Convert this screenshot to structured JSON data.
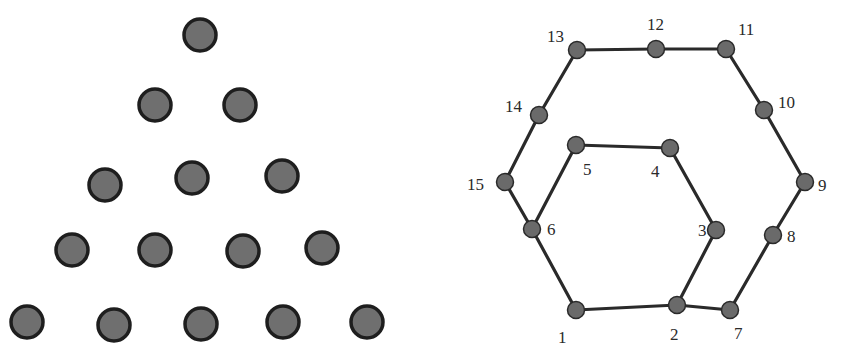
{
  "figure": {
    "left_panel": {
      "description": "Triangular arrangement of 15 circles in 5 rows",
      "rows": [
        1,
        2,
        3,
        4,
        5
      ],
      "fill_color": "#6f6f6f",
      "stroke_color": "#1e1e1e"
    },
    "right_panel": {
      "description": "Graph with 15 numbered vertices forming nested hexagonal paths",
      "node_color": "#6a6a6a",
      "edge_color": "#2a2a2a",
      "nodes": [
        {
          "id": 1,
          "label": "1"
        },
        {
          "id": 2,
          "label": "2"
        },
        {
          "id": 3,
          "label": "3"
        },
        {
          "id": 4,
          "label": "4"
        },
        {
          "id": 5,
          "label": "5"
        },
        {
          "id": 6,
          "label": "6"
        },
        {
          "id": 7,
          "label": "7"
        },
        {
          "id": 8,
          "label": "8"
        },
        {
          "id": 9,
          "label": "9"
        },
        {
          "id": 10,
          "label": "10"
        },
        {
          "id": 11,
          "label": "11"
        },
        {
          "id": 12,
          "label": "12"
        },
        {
          "id": 13,
          "label": "13"
        },
        {
          "id": 14,
          "label": "14"
        },
        {
          "id": 15,
          "label": "15"
        }
      ],
      "edges": [
        [
          1,
          2
        ],
        [
          2,
          3
        ],
        [
          3,
          4
        ],
        [
          4,
          5
        ],
        [
          5,
          6
        ],
        [
          6,
          1
        ],
        [
          2,
          7
        ],
        [
          7,
          8
        ],
        [
          8,
          9
        ],
        [
          9,
          10
        ],
        [
          10,
          11
        ],
        [
          11,
          12
        ],
        [
          12,
          13
        ],
        [
          13,
          14
        ],
        [
          14,
          15
        ],
        [
          15,
          6
        ]
      ]
    }
  }
}
